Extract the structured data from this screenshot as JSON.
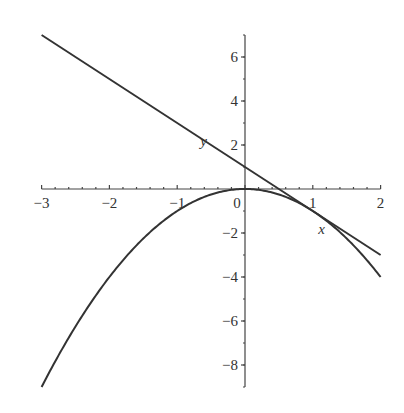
{
  "chart_data": {
    "type": "line",
    "title": "",
    "xlabel": "x",
    "ylabel": "y",
    "xlim": [
      -3,
      2
    ],
    "ylim": [
      -9,
      7
    ],
    "grid": false,
    "legend": null,
    "x_ticks": [
      "-3",
      "-2",
      "-1",
      "0",
      "1",
      "2"
    ],
    "y_ticks": [
      "6",
      "4",
      "2",
      "-2",
      "-4",
      "-6",
      "-8"
    ],
    "series": [
      {
        "name": "parabola y = -x^2",
        "x": [
          -3,
          -2,
          -1,
          0,
          1,
          2
        ],
        "values": [
          -9,
          -4,
          -1,
          0,
          -1,
          -4
        ]
      },
      {
        "name": "tangent line y = -2x + 1",
        "x": [
          -3,
          2
        ],
        "values": [
          7,
          -3
        ]
      }
    ],
    "annotations": [
      "tangent touches parabola at (1, -1)"
    ]
  }
}
